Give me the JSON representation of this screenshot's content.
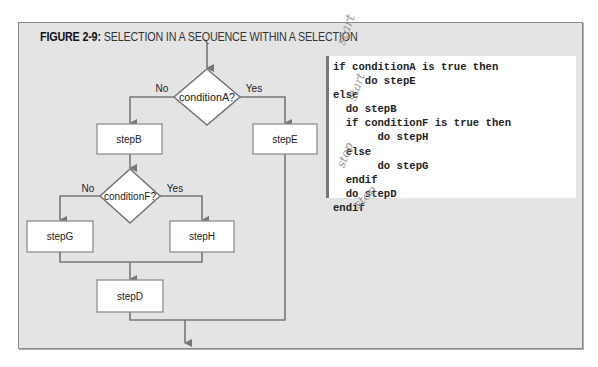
{
  "figure": {
    "label": "FIGURE 2-9:",
    "title": "SELECTION IN A SEQUENCE WITHIN A SELECTION"
  },
  "flowchart": {
    "decisions": [
      {
        "id": "conditionA",
        "text": "conditionA?",
        "no_label": "No",
        "yes_label": "Yes"
      },
      {
        "id": "conditionF",
        "text": "conditionF?",
        "no_label": "No",
        "yes_label": "Yes"
      }
    ],
    "steps": {
      "stepB": "stepB",
      "stepE": "stepE",
      "stepG": "stepG",
      "stepH": "stepH",
      "stepD": "stepD"
    }
  },
  "pseudocode": {
    "lines": [
      "if conditionA is true then",
      "     do stepE",
      "else",
      "  do stepB",
      "  if conditionF is true then",
      "       do stepH",
      "  else",
      "       do stepG",
      "  endif",
      "  do stepD",
      "endif"
    ]
  },
  "annotations": {
    "start_1": "start",
    "start_2": "start",
    "stop_1": "stop",
    "stop_2": "stop"
  },
  "colors": {
    "frame_bg": "#e4e4e4",
    "line": "#777777",
    "box_fill": "#ffffff"
  }
}
